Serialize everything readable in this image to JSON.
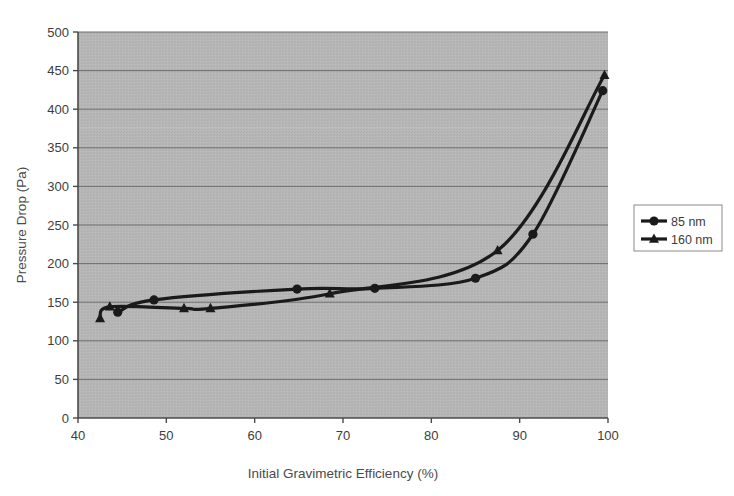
{
  "chart_data": {
    "type": "line",
    "title": "",
    "xlabel": "Initial Gravimetric Efficiency (%)",
    "ylabel": "Pressure Drop (Pa)",
    "xlim": [
      40,
      100
    ],
    "ylim": [
      0,
      500
    ],
    "xticks": [
      40,
      50,
      60,
      70,
      80,
      90,
      100
    ],
    "yticks": [
      0,
      50,
      100,
      150,
      200,
      250,
      300,
      350,
      400,
      450,
      500
    ],
    "xtick_labels": [
      "40",
      "50",
      "60",
      "70",
      "80",
      "90",
      "100"
    ],
    "ytick_labels": [
      "0",
      "50",
      "100",
      "150",
      "200",
      "250",
      "300",
      "350",
      "400",
      "450",
      "500"
    ],
    "grid": "horizontal",
    "plot_background": "#b5b5b5",
    "legend_position": "right",
    "series": [
      {
        "name": "85 nm",
        "marker": "circle",
        "color": "#1a1a1a",
        "x": [
          44.5,
          48.6,
          64.8,
          73.6,
          85.0,
          91.5,
          99.4
        ],
        "y": [
          137,
          153,
          167,
          168,
          181,
          238,
          424
        ]
      },
      {
        "name": "160 nm",
        "marker": "triangle",
        "color": "#1a1a1a",
        "x": [
          42.5,
          43.6,
          52.0,
          55.0,
          68.5,
          87.5,
          99.6
        ],
        "y": [
          129,
          144,
          142,
          142,
          161,
          217,
          444
        ]
      }
    ]
  },
  "legend": {
    "items": [
      {
        "label": "85 nm",
        "marker": "circle"
      },
      {
        "label": "160 nm",
        "marker": "triangle"
      }
    ]
  }
}
